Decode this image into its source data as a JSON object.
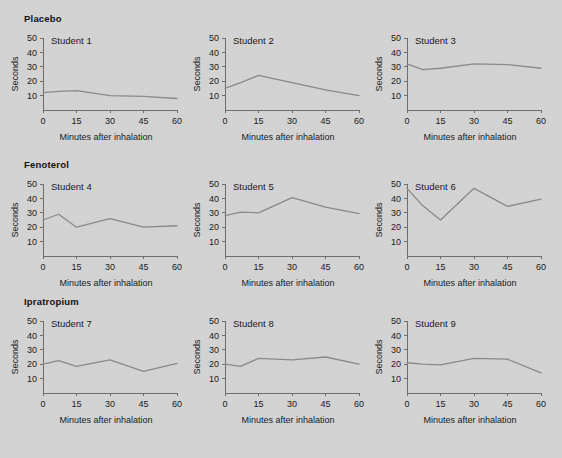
{
  "figure": {
    "background_color": "#d3d3d3",
    "line_color": "#8a8a8a",
    "axis_color": "#6e6e6e",
    "text_color": "#1a1a1a"
  },
  "groups": [
    {
      "label": "Placebo"
    },
    {
      "label": "Fenoterol"
    },
    {
      "label": "Ipratropium"
    }
  ],
  "axes": {
    "xlabel": "Minutes after inhalation",
    "ylabel": "Seconds",
    "xticks": [
      0,
      15,
      30,
      45,
      60
    ],
    "yticks": [
      10,
      20,
      30,
      40,
      50
    ],
    "xlim": [
      0,
      60
    ],
    "ylim": [
      0,
      50
    ]
  },
  "panels": [
    {
      "title": "Student 1"
    },
    {
      "title": "Student 2"
    },
    {
      "title": "Student 3"
    },
    {
      "title": "Student 4"
    },
    {
      "title": "Student 5"
    },
    {
      "title": "Student 6"
    },
    {
      "title": "Student 7"
    },
    {
      "title": "Student 8"
    },
    {
      "title": "Student 9"
    }
  ],
  "chart_data": {
    "type": "line",
    "title": "",
    "xlabel": "Minutes after inhalation",
    "ylabel": "Seconds",
    "xlim": [
      0,
      60
    ],
    "ylim": [
      0,
      50
    ],
    "xticks": [
      0,
      15,
      30,
      45,
      60
    ],
    "yticks": [
      10,
      20,
      30,
      40,
      50
    ],
    "grid": false,
    "legend": "none",
    "layout": "3x3 small multiples, rows grouped by treatment",
    "x": [
      0,
      7,
      15,
      30,
      45,
      60
    ],
    "groups": [
      "Placebo",
      "Fenoterol",
      "Ipratropium"
    ],
    "series": [
      {
        "name": "Student 1",
        "group": "Placebo",
        "values": [
          12,
          13,
          13.5,
          10,
          9.5,
          8
        ]
      },
      {
        "name": "Student 2",
        "group": "Placebo",
        "values": [
          15,
          19,
          24,
          19,
          14,
          10
        ]
      },
      {
        "name": "Student 3",
        "group": "Placebo",
        "values": [
          32,
          28,
          29,
          32,
          31.5,
          29
        ]
      },
      {
        "name": "Student 4",
        "group": "Fenoterol",
        "values": [
          25,
          29,
          20,
          26,
          20,
          21
        ]
      },
      {
        "name": "Student 5",
        "group": "Fenoterol",
        "values": [
          28,
          30.5,
          30,
          40.5,
          34,
          29.5
        ]
      },
      {
        "name": "Student 6",
        "group": "Fenoterol",
        "values": [
          47,
          35,
          25,
          47,
          34.5,
          39.5
        ]
      },
      {
        "name": "Student 7",
        "group": "Ipratropium",
        "values": [
          20,
          22.5,
          18.5,
          23,
          15,
          20.5
        ]
      },
      {
        "name": "Student 8",
        "group": "Ipratropium",
        "values": [
          20,
          18.5,
          24,
          23,
          25,
          20
        ]
      },
      {
        "name": "Student 9",
        "group": "Ipratropium",
        "values": [
          21,
          20,
          19.5,
          24,
          23.5,
          14
        ]
      }
    ]
  }
}
